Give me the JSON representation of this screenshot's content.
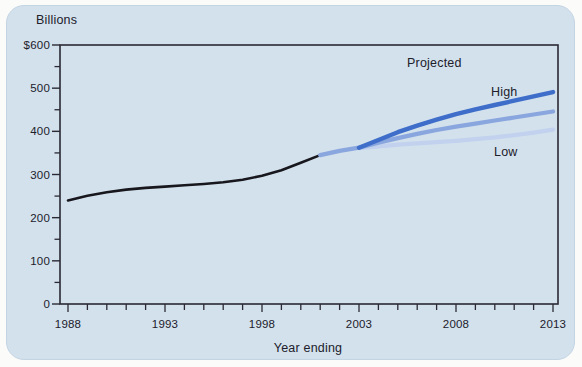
{
  "page": {
    "background": "#fbfbfa"
  },
  "card": {
    "background": "#d3e1ed",
    "border": "#c3d4e3"
  },
  "chart_data": {
    "type": "line",
    "title": "",
    "y_axis_unit": "Billions",
    "xlabel": "Year ending",
    "ylabel": "",
    "ylim": [
      0,
      600
    ],
    "xlim": [
      1988,
      2013
    ],
    "grid": false,
    "legend": "inline-annotations",
    "axis_color": "#2a2a34",
    "y_ticks": [
      0,
      100,
      200,
      300,
      400,
      500,
      600
    ],
    "y_tick_labels": [
      "0",
      "100",
      "200",
      "300",
      "400",
      "500",
      "$600"
    ],
    "y_minor_ticks": [
      50,
      150,
      250,
      350,
      450,
      550
    ],
    "x_tick_years": [
      1988,
      1993,
      1998,
      2003,
      2008,
      2013
    ],
    "x_minor_tick_every_year": true,
    "annotations": {
      "projected": "Projected",
      "high": "High",
      "low": "Low"
    },
    "series": [
      {
        "name": "actual",
        "color": "#17171d",
        "width": 2.6,
        "x": [
          1988,
          1989,
          1990,
          1991,
          1992,
          1993,
          1994,
          1995,
          1996,
          1997,
          1998,
          1999,
          2000,
          2001
        ],
        "y": [
          240,
          251,
          259,
          265,
          269,
          272,
          275,
          278,
          282,
          288,
          297,
          310,
          327,
          345
        ]
      },
      {
        "name": "projected-low",
        "color": "#c2d2ee",
        "width": 4.3,
        "x": [
          2003,
          2004,
          2005,
          2006,
          2007,
          2008,
          2009,
          2010,
          2011,
          2012,
          2013
        ],
        "y": [
          361,
          365,
          369,
          372,
          375,
          378,
          382,
          386,
          391,
          397,
          404
        ]
      },
      {
        "name": "projected-middle",
        "color": "#8aa6de",
        "width": 4.3,
        "x": [
          2001,
          2002,
          2003,
          2004,
          2005,
          2006,
          2007,
          2008,
          2009,
          2010,
          2011,
          2012,
          2013
        ],
        "y": [
          345,
          355,
          362,
          374,
          384,
          394,
          403,
          411,
          418,
          425,
          432,
          439,
          446
        ]
      },
      {
        "name": "projected-high",
        "color": "#3e6ec9",
        "width": 4.4,
        "x": [
          2003,
          2004,
          2005,
          2006,
          2007,
          2008,
          2009,
          2010,
          2011,
          2012,
          2013
        ],
        "y": [
          362,
          380,
          398,
          413,
          427,
          440,
          451,
          461,
          471,
          481,
          491
        ]
      }
    ]
  }
}
